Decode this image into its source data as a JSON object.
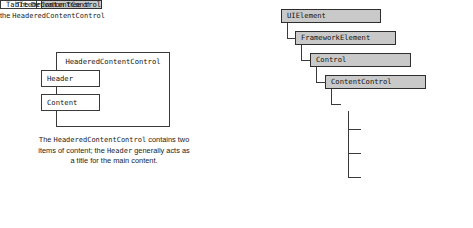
{
  "left_diagram": {
    "outer_box_label": "HeaderedContentControl",
    "header_box_label": "Header",
    "content_box_label": "Content",
    "caption": {
      "line1_part1": "The ",
      "line1_mono": "HeaderedContentControl",
      "line1_part2": " contains two",
      "line2_part1": "items of content; the ",
      "line2_mono": "Header",
      "line2_part2": " generally acts as",
      "line3": "a title for the main content."
    }
  },
  "right_diagram": {
    "nodes": [
      {
        "label": "UIElement",
        "shaded": true
      },
      {
        "label": "FrameworkElement",
        "shaded": true
      },
      {
        "label": "Control",
        "shaded": true
      },
      {
        "label": "ContentControl",
        "shaded": true
      },
      {
        "label": "HeaderedContentControl",
        "shaded": true
      },
      {
        "label": "GroupBox",
        "shaded": false
      },
      {
        "label": "Expander",
        "shaded": false
      },
      {
        "label": "TabItem",
        "shaded": false
      }
    ],
    "caption": {
      "line1": "The Derivation Tree of",
      "line2_part1": "the ",
      "line2_mono": "HeaderedContentControl"
    }
  },
  "colors": {
    "background": "#ffffff",
    "box_fill_shaded": "#c9c9c9",
    "box_fill_plain": "#ffffff",
    "border": "#3a3a3a",
    "text": "#141414"
  }
}
